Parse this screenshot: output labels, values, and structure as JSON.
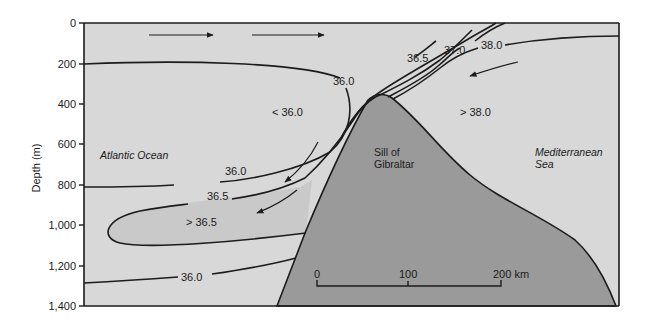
{
  "figure": {
    "type": "cross-section diagram",
    "colors": {
      "water": "#d8d8d8",
      "high_salinity_lens": "#c9c9c9",
      "sill": "#9a9a9a",
      "lines": "#1c1c1c",
      "background": "#ffffff"
    },
    "y_axis": {
      "title": "Depth (m)",
      "ticks": [
        "0",
        "200",
        "400",
        "600",
        "800",
        "1,000",
        "1,200",
        "1,400"
      ]
    },
    "regions": {
      "atlantic": "Atlantic Ocean",
      "mediterranean_line1": "Mediterranean",
      "mediterranean_line2": "Sea",
      "sill_line1": "Sill of",
      "sill_line2": "Gibraltar"
    },
    "salinity_labels": {
      "less_than_36": "< 36.0",
      "greater_than_38": "> 38.0",
      "greater_than_36_5": "> 36.5"
    },
    "contour_labels": {
      "c36_upper": "36.0",
      "c36_mid": "36.0",
      "c36_5_lower": "36.5",
      "c36_deep": "36.0",
      "c36_5_upper": "36.5",
      "c37": "37.0",
      "c38": "38.0"
    },
    "scale_bar": {
      "ticks": [
        "0",
        "100",
        "200 km"
      ]
    }
  }
}
